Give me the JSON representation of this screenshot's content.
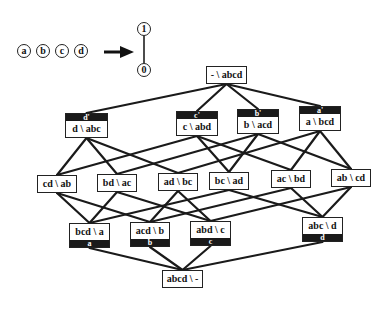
{
  "legend": {
    "atoms": [
      "a",
      "b",
      "c",
      "d"
    ],
    "chain_top": "1",
    "chain_bottom": "0",
    "arrow": "right-arrow"
  },
  "lattice": {
    "nodes": [
      {
        "id": "top",
        "label": "- \\ abcd",
        "header": "",
        "footer": "",
        "x": 206,
        "y": 66,
        "w": 41
      },
      {
        "id": "d_",
        "label": "d \\ abc",
        "header": "d'",
        "footer": "",
        "x": 65,
        "y": 113,
        "w": 43
      },
      {
        "id": "c_",
        "label": "c \\ abd",
        "header": "c'",
        "footer": "",
        "x": 176,
        "y": 111,
        "w": 42
      },
      {
        "id": "b_",
        "label": "b \\ acd",
        "header": "b'",
        "footer": "",
        "x": 237,
        "y": 109,
        "w": 42
      },
      {
        "id": "a_",
        "label": "a \\ bcd",
        "header": "a'",
        "footer": "",
        "x": 299,
        "y": 106,
        "w": 42
      },
      {
        "id": "cd",
        "label": "cd \\ ab",
        "header": "",
        "footer": "",
        "x": 37,
        "y": 175,
        "w": 40
      },
      {
        "id": "bd",
        "label": "bd \\ ac",
        "header": "",
        "footer": "",
        "x": 97,
        "y": 174,
        "w": 40
      },
      {
        "id": "ad",
        "label": "ad \\ bc",
        "header": "",
        "footer": "",
        "x": 158,
        "y": 173,
        "w": 40
      },
      {
        "id": "bc",
        "label": "bc \\ ad",
        "header": "",
        "footer": "",
        "x": 209,
        "y": 172,
        "w": 40
      },
      {
        "id": "ac",
        "label": "ac \\ bd",
        "header": "",
        "footer": "",
        "x": 271,
        "y": 170,
        "w": 40
      },
      {
        "id": "ab",
        "label": "ab \\ cd",
        "header": "",
        "footer": "",
        "x": 331,
        "y": 169,
        "w": 40
      },
      {
        "id": "bcd",
        "label": "bcd \\ a",
        "header": "",
        "footer": "a",
        "x": 69,
        "y": 223,
        "w": 41
      },
      {
        "id": "acd",
        "label": "acd \\ b",
        "header": "",
        "footer": "b",
        "x": 130,
        "y": 222,
        "w": 40
      },
      {
        "id": "abd",
        "label": "abd \\ c",
        "header": "",
        "footer": "c",
        "x": 190,
        "y": 221,
        "w": 41
      },
      {
        "id": "abc",
        "label": "abc \\ d",
        "header": "",
        "footer": "d",
        "x": 302,
        "y": 217,
        "w": 41
      },
      {
        "id": "bot",
        "label": "abcd \\ -",
        "header": "",
        "footer": "",
        "x": 162,
        "y": 270,
        "w": 41
      }
    ],
    "edges": [
      [
        "top",
        "d_"
      ],
      [
        "top",
        "c_"
      ],
      [
        "top",
        "b_"
      ],
      [
        "top",
        "a_"
      ],
      [
        "d_",
        "cd"
      ],
      [
        "d_",
        "bd"
      ],
      [
        "d_",
        "ad"
      ],
      [
        "c_",
        "cd"
      ],
      [
        "c_",
        "bc"
      ],
      [
        "c_",
        "ac"
      ],
      [
        "b_",
        "bd"
      ],
      [
        "b_",
        "bc"
      ],
      [
        "b_",
        "ab"
      ],
      [
        "a_",
        "ad"
      ],
      [
        "a_",
        "ac"
      ],
      [
        "a_",
        "ab"
      ],
      [
        "cd",
        "bcd"
      ],
      [
        "cd",
        "acd"
      ],
      [
        "bd",
        "bcd"
      ],
      [
        "bd",
        "abd"
      ],
      [
        "ad",
        "acd"
      ],
      [
        "ad",
        "abd"
      ],
      [
        "bc",
        "bcd"
      ],
      [
        "bc",
        "abc"
      ],
      [
        "ac",
        "acd"
      ],
      [
        "ac",
        "abc"
      ],
      [
        "ab",
        "abd"
      ],
      [
        "ab",
        "abc"
      ],
      [
        "bcd",
        "bot"
      ],
      [
        "acd",
        "bot"
      ],
      [
        "abd",
        "bot"
      ],
      [
        "abc",
        "bot"
      ]
    ]
  }
}
